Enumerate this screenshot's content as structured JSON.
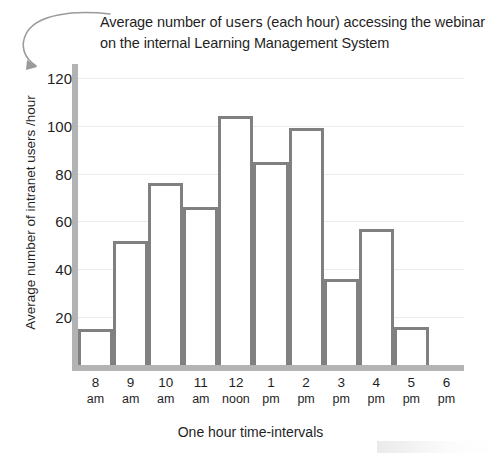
{
  "chart_data": {
    "type": "bar",
    "title": "Average number of users (each hour) accessing the webinar on the internal Learning Management System",
    "title_part_1": "Average number of ",
    "title_emphasis": "users",
    "title_part_2": " (each hour) accessing the webinar on the internal Learning Management System",
    "xlabel": "One hour time-intervals",
    "ylabel": "Average number of intranet users  /hour",
    "categories": [
      "8 am",
      "9 am",
      "10 am",
      "11 am",
      "12 noon",
      "1 pm",
      "2 pm",
      "3 pm",
      "4 pm",
      "5 pm"
    ],
    "bin_edges": [
      "8 am",
      "9 am",
      "10 am",
      "11 am",
      "12 noon",
      "1 pm",
      "2 pm",
      "3 pm",
      "4 pm",
      "5 pm",
      "6 pm"
    ],
    "values": [
      15,
      52,
      76,
      66,
      104,
      85,
      99,
      36,
      57,
      16
    ],
    "ylim": [
      0,
      125
    ],
    "yticks": [
      20,
      40,
      60,
      80,
      100,
      120
    ],
    "ytick_labels": [
      "20",
      "40",
      "60",
      "80",
      "100",
      "120"
    ],
    "xtick_numbers": [
      "8",
      "9",
      "10",
      "11",
      "12",
      "1",
      "2",
      "3",
      "4",
      "5",
      "6"
    ],
    "xtick_units": [
      "am",
      "am",
      "am",
      "am",
      "noon",
      "pm",
      "pm",
      "pm",
      "pm",
      "pm",
      "pm"
    ],
    "grid": true,
    "legend": false,
    "bar_outline_color": "#808080",
    "bar_fill_color": "#ffffff",
    "axis_color": "#b3b3b3",
    "gridline_color": "#ececec",
    "text_color": "#1f1f1f"
  },
  "annotations": {
    "title_pointer": "curved-arrow-from-title-to-y-axis-top"
  }
}
